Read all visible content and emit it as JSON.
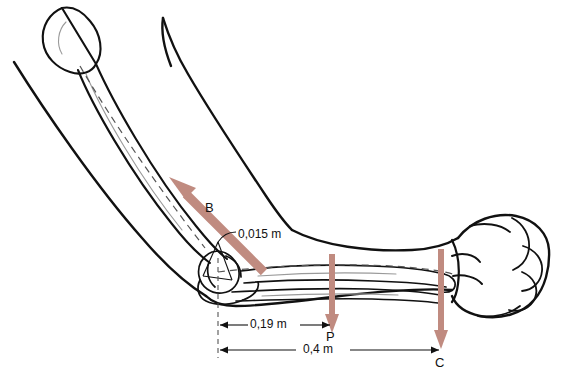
{
  "figure": {
    "anatomy": {
      "upper_arm": "humerus",
      "forearm": "radius-ulna",
      "hand": "clenched-fist",
      "joint": "elbow"
    }
  },
  "colors": {
    "force_arrow": "#c08b80",
    "force_arrow_dark": "#b5796c",
    "outline": "#111111",
    "bone_light": "#8a8a8a",
    "dimension_line": "#111111",
    "dashed_ref": "#555555",
    "background": "#ffffff"
  },
  "forces": [
    {
      "id": "B",
      "label": "B",
      "description": "biceps muscle force",
      "direction": "up-left",
      "label_x": 208,
      "label_y": 200
    },
    {
      "id": "P",
      "label": "P",
      "description": "forearm weight",
      "direction": "down",
      "label_x": 326,
      "label_y": 329
    },
    {
      "id": "C",
      "label": "C",
      "description": "load carried in hand",
      "direction": "down",
      "label_x": 435,
      "label_y": 355
    }
  ],
  "dimensions": [
    {
      "id": "moment-arm",
      "value": "0,015 m",
      "description": "biceps moment arm at elbow",
      "label_x": 238,
      "label_y": 227
    },
    {
      "id": "weight-distance",
      "value": "0,19 m",
      "description": "elbow to forearm centre of gravity",
      "label_x": 258,
      "label_y": 313
    },
    {
      "id": "load-distance",
      "value": "0,4 m",
      "description": "elbow to hand load",
      "label_x": 311,
      "label_y": 338
    }
  ]
}
